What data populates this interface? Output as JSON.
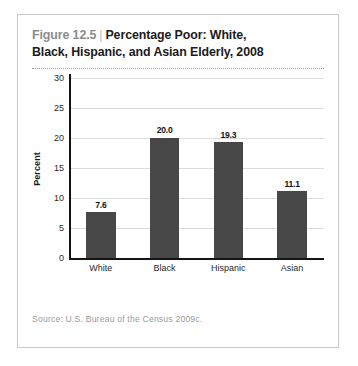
{
  "figure": {
    "number_label": "Figure 12.5",
    "separator": "|",
    "title": "Percentage Poor: White, Black, Hispanic, and Asian Elderly, 2008",
    "title_line1": "Percentage Poor: White,",
    "title_line2": "Black, Hispanic, and Asian Elderly, 2008",
    "source": "Source:  U.S. Bureau of the Census 2009c.",
    "colors": {
      "bar": "#474747",
      "axis": "#141414",
      "gridline": "#dcdcdc",
      "frame_border": "#c9c9c9",
      "figure_number_text": "#8c8c8c",
      "title_text": "#1b1b1b",
      "source_text": "#9a9a9a",
      "background": "#ffffff"
    }
  },
  "chart_data": {
    "type": "bar",
    "title": "Percentage Poor: White, Black, Hispanic, and Asian Elderly, 2008",
    "categories": [
      "White",
      "Black",
      "Hispanic",
      "Asian"
    ],
    "values": [
      7.6,
      20.0,
      19.3,
      11.1
    ],
    "data_labels": [
      "7.6",
      "20.0",
      "19.3",
      "11.1"
    ],
    "xlabel": "",
    "ylabel": "Percent",
    "ylim": [
      0,
      30
    ],
    "yticks": [
      0,
      5,
      10,
      15,
      20,
      25,
      30
    ],
    "ytick_labels": [
      "0",
      "5",
      "10",
      "15",
      "20",
      "25",
      "30"
    ],
    "grid": true,
    "legend": false,
    "legend_position": "none",
    "source": "Source:  U.S. Bureau of the Census 2009c."
  }
}
